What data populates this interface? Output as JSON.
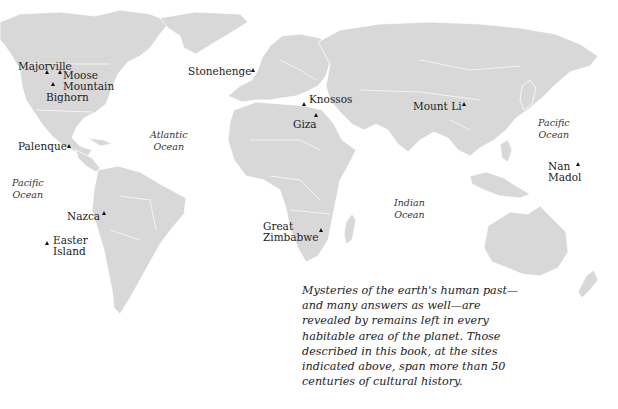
{
  "map": {
    "land_color": "#d8d8d8",
    "border_color": "#ffffff",
    "background": "#ffffff",
    "marker_icon": "triangle-marker",
    "sites": [
      {
        "name": "Majorville",
        "lines": [
          "Majorville"
        ],
        "marker": [
          47,
          72
        ],
        "label": [
          18,
          61
        ]
      },
      {
        "name": "Moose Mountain",
        "lines": [
          "Moose",
          "Mountain"
        ],
        "marker": [
          60,
          72
        ],
        "label": [
          63,
          70
        ]
      },
      {
        "name": "Bighorn",
        "lines": [
          "Bighorn"
        ],
        "marker": [
          53,
          84
        ],
        "label": [
          46,
          92
        ]
      },
      {
        "name": "Stonehenge",
        "lines": [
          "Stonehenge"
        ],
        "marker": [
          253,
          70
        ],
        "label": [
          188,
          66
        ]
      },
      {
        "name": "Knossos",
        "lines": [
          "Knossos"
        ],
        "marker": [
          304,
          104
        ],
        "label": [
          309,
          94
        ]
      },
      {
        "name": "Giza",
        "lines": [
          "Giza"
        ],
        "marker": [
          316,
          115
        ],
        "label": [
          293,
          119
        ]
      },
      {
        "name": "Mount Li",
        "lines": [
          "Mount Li"
        ],
        "marker": [
          464,
          104
        ],
        "label": [
          413,
          101
        ]
      },
      {
        "name": "Palenque",
        "lines": [
          "Palenque"
        ],
        "marker": [
          69,
          146
        ],
        "label": [
          18,
          141
        ]
      },
      {
        "name": "Nan Madol",
        "lines": [
          "Nan",
          "Madol"
        ],
        "marker": [
          578,
          164
        ],
        "label": [
          548,
          161
        ]
      },
      {
        "name": "Nazca",
        "lines": [
          "Nazca"
        ],
        "marker": [
          104,
          213
        ],
        "label": [
          67,
          211
        ]
      },
      {
        "name": "Easter Island",
        "lines": [
          "Easter",
          "Island"
        ],
        "marker": [
          47,
          243
        ],
        "label": [
          53,
          235
        ]
      },
      {
        "name": "Great Zimbabwe",
        "lines": [
          "Great",
          "Zimbabwe"
        ],
        "marker": [
          321,
          230
        ],
        "label": [
          263,
          221
        ]
      }
    ],
    "oceans": [
      {
        "name": "Atlantic Ocean",
        "lines": [
          "Atlantic",
          "Ocean"
        ],
        "pos": [
          150,
          129
        ]
      },
      {
        "name": "Pacific Ocean (east)",
        "lines": [
          "Pacific",
          "Ocean"
        ],
        "pos": [
          12,
          177
        ]
      },
      {
        "name": "Pacific Ocean (west)",
        "lines": [
          "Pacific",
          "Ocean"
        ],
        "pos": [
          538,
          117
        ]
      },
      {
        "name": "Indian Ocean",
        "lines": [
          "Indian",
          "Ocean"
        ],
        "pos": [
          394,
          197
        ]
      }
    ]
  },
  "caption": {
    "lines": [
      "Mysteries of the earth's human past—",
      "and many answers as well—are",
      "revealed by remains left in every",
      "habitable area of the planet. Those",
      "described in this book, at the sites",
      "indicated above, span more than 50",
      "centuries of cultural history."
    ]
  }
}
